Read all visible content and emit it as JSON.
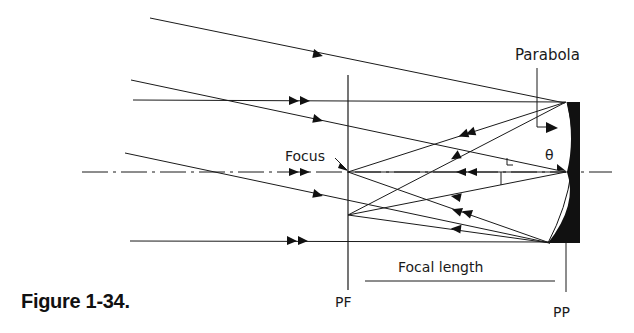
{
  "figure": {
    "caption": "Figure 1-34.",
    "labels": {
      "parabola": "Parabola",
      "focus": "Focus",
      "theta": "θ",
      "focal_length": "Focal length",
      "pf": "PF",
      "pp": "PP"
    },
    "colors": {
      "ink": "#1a1a1a",
      "background": "#ffffff"
    }
  }
}
